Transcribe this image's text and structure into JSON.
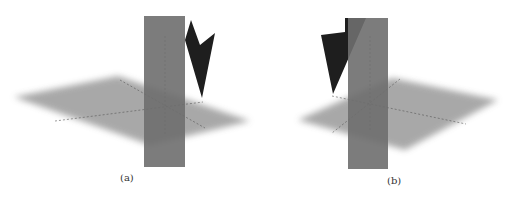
{
  "figures": [
    {
      "id": "a",
      "caption": "(a)"
    },
    {
      "id": "b",
      "caption": "(b)"
    }
  ],
  "colors": {
    "horizontal_plane": "#9a9a9a",
    "vertical_plane": "#7a7a7a",
    "dark_plane": "#1e1e1e",
    "axis": "#555555"
  }
}
